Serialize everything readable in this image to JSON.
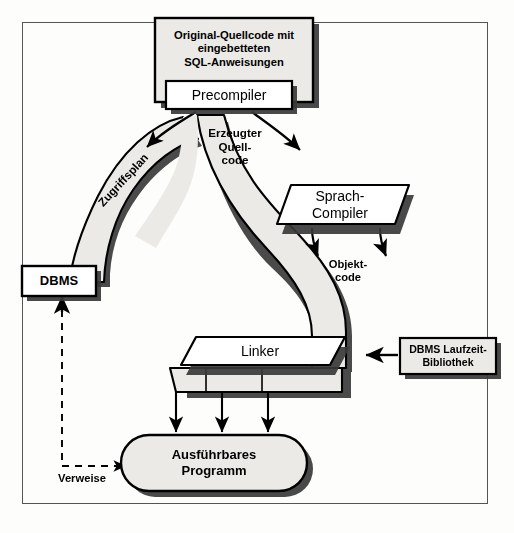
{
  "diagram": {
    "title_nodes": {
      "source_box": "Original-Quellcode mit\neingebetteten\nSQL-Anweisungen",
      "precompiler": "Precompiler",
      "dbms": "DBMS",
      "sprach_compiler": "Sprach-\nCompiler",
      "linker": "Linker",
      "runtime_library": "DBMS Laufzeit-\nBibliothek",
      "executable": "Ausführbares\nProgramm"
    },
    "flow_labels": {
      "access_plan": "Zugriffsplan",
      "generated_source": "Erzeugter\nQuell-\ncode",
      "object_code": "Objekt-\ncode",
      "references": "Verweise"
    },
    "colors": {
      "band_fill": "#ebeae6",
      "box_fill": "#ebeae6",
      "white_fill": "#ffffff",
      "stroke": "#000000",
      "shadow": "#3a3a3a",
      "frame": "#555555",
      "page": "#fdfdfb"
    }
  }
}
